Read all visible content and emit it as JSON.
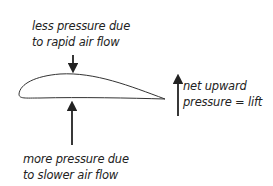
{
  "diagram": {
    "top_label": {
      "line1": "less pressure due",
      "line2": "to rapid air flow"
    },
    "bottom_label": {
      "line1": "more pressure due",
      "line2": "to slower air flow"
    },
    "lift_label": {
      "line1": "net upward",
      "line2": "pressure = lift"
    },
    "colors": {
      "stroke": "#222222",
      "background": "#ffffff"
    }
  }
}
